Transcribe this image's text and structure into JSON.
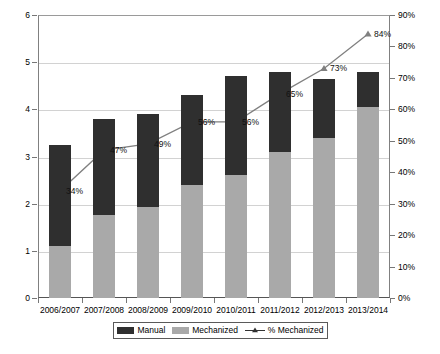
{
  "chart_data": {
    "type": "bar",
    "title": "",
    "subtitle": "",
    "xlabel": "",
    "ylabel": "",
    "y2label": "",
    "categories": [
      "2006/2007",
      "2007/2008",
      "2008/2009",
      "2009/2010",
      "2010/2011",
      "2011/2012",
      "2012/2013",
      "2013/2014"
    ],
    "ylim": [
      0,
      6
    ],
    "yticks": [
      "0",
      "1",
      "2",
      "3",
      "4",
      "5",
      "6"
    ],
    "ytick_values": [
      0,
      1,
      2,
      3,
      4,
      5,
      6
    ],
    "y2lim": [
      0,
      90
    ],
    "y2ticks": [
      "0%",
      "10%",
      "20%",
      "30%",
      "40%",
      "50%",
      "60%",
      "70%",
      "80%",
      "90%"
    ],
    "y2tick_values": [
      0,
      10,
      20,
      30,
      40,
      50,
      60,
      70,
      80,
      90
    ],
    "grid": true,
    "legend_position": "bottom",
    "stacked": true,
    "series": [
      {
        "name": "Mechanized",
        "type": "bar",
        "axis": "left",
        "color": "#a9a9a9",
        "values": [
          1.1,
          1.75,
          1.92,
          2.4,
          2.6,
          3.1,
          3.4,
          4.05
        ]
      },
      {
        "name": "Manual",
        "type": "bar",
        "axis": "left",
        "color": "#2f2f2f",
        "values": [
          2.15,
          2.05,
          1.98,
          1.9,
          2.1,
          1.7,
          1.25,
          0.75
        ]
      },
      {
        "name": "% Mechanized",
        "type": "line",
        "axis": "right",
        "color": "#808080",
        "values": [
          34,
          47,
          49,
          56,
          56,
          65,
          73,
          84
        ],
        "labels": [
          "34%",
          "47%",
          "49%",
          "56%",
          "56%",
          "65%",
          "73%",
          "84%"
        ]
      }
    ],
    "bar_totals": [
      3.25,
      3.8,
      3.9,
      4.3,
      4.7,
      4.8,
      4.65,
      4.8
    ]
  },
  "legend": {
    "items": [
      {
        "label": "Manual",
        "marker": "square-dark-swatch"
      },
      {
        "label": "Mechanized",
        "marker": "square-gray-swatch"
      },
      {
        "label": "% Mechanized",
        "marker": "line-triangle-marker"
      }
    ]
  },
  "colors": {
    "manual": "#2f2f2f",
    "mechanized": "#a9a9a9",
    "line": "#808080",
    "grid": "#d2d2d2",
    "axis": "#555555",
    "background": "#ffffff"
  }
}
